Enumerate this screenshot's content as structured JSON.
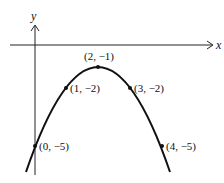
{
  "diagram": {
    "type": "parabola-graph",
    "axes": {
      "x_label": "x",
      "y_label": "y"
    },
    "points": [
      {
        "label": "(2, −1)",
        "x": 2,
        "y": -1,
        "role": "vertex"
      },
      {
        "label": "(1, −2)",
        "x": 1,
        "y": -2
      },
      {
        "label": "(3, −2)",
        "x": 3,
        "y": -2
      },
      {
        "label": "(0, −5)",
        "x": 0,
        "y": -5
      },
      {
        "label": "(4, −5)",
        "x": 4,
        "y": -5
      }
    ]
  }
}
